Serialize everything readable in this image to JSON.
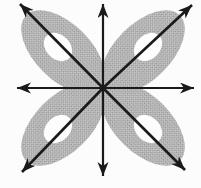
{
  "figure": {
    "name": "eight-direction-arrow-rosette",
    "canvas": {
      "width": 201,
      "height": 188
    },
    "colors": {
      "background": "#fcfcfc",
      "lobe_base": "#cdcdcd",
      "lobe_dot": "#8f8f8f",
      "hole": "#fdfdfd",
      "arrow": "#1a1a1a"
    },
    "center": {
      "x": 103,
      "y": 88
    },
    "lobe_radii": {
      "outer_rx": 52,
      "outer_ry": 28,
      "hole_rx": 16,
      "hole_ry": 12
    },
    "lobes": [
      {
        "name": "lobe-top-left",
        "cx": 63,
        "cy": 52,
        "rotation": 45,
        "hole_cx": 58,
        "hole_cy": 47
      },
      {
        "name": "lobe-top-right",
        "cx": 143,
        "cy": 52,
        "rotation": -45,
        "hole_cx": 148,
        "hole_cy": 47
      },
      {
        "name": "lobe-bottom-left",
        "cx": 63,
        "cy": 124,
        "rotation": -45,
        "hole_cx": 58,
        "hole_cy": 129
      },
      {
        "name": "lobe-bottom-right",
        "cx": 143,
        "cy": 124,
        "rotation": 45,
        "hole_cx": 148,
        "hole_cy": 129
      }
    ],
    "arrows": [
      {
        "name": "arrow-north",
        "x": 103,
        "y": 4,
        "width": 2.2
      },
      {
        "name": "arrow-south",
        "x": 103,
        "y": 176,
        "width": 2.2
      },
      {
        "name": "arrow-west",
        "x": 17,
        "y": 88,
        "width": 2.2
      },
      {
        "name": "arrow-east",
        "x": 194,
        "y": 88,
        "width": 2.2
      },
      {
        "name": "arrow-northwest",
        "x": 20,
        "y": 4,
        "width": 2.6
      },
      {
        "name": "arrow-northeast",
        "x": 192,
        "y": 5,
        "width": 2.6
      },
      {
        "name": "arrow-southwest",
        "x": 22,
        "y": 172,
        "width": 2.6
      },
      {
        "name": "arrow-southeast",
        "x": 185,
        "y": 170,
        "width": 2.6
      }
    ],
    "arrowhead": {
      "length": 14,
      "half_width": 5.5,
      "notch": 4
    }
  }
}
